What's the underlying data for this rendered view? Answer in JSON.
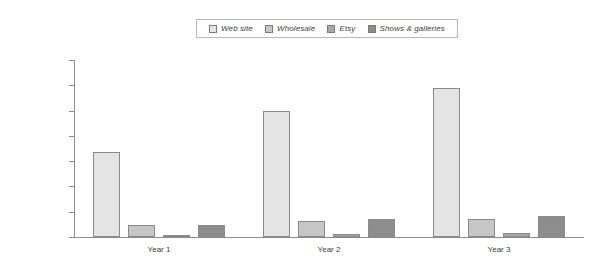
{
  "chart_data": {
    "type": "bar",
    "title": "",
    "xlabel": "",
    "ylabel": "",
    "categories": [
      "Year 1",
      "Year 2",
      "Year 3"
    ],
    "ylim": [
      0,
      70000
    ],
    "ytick_values": [
      0,
      10000,
      20000,
      30000,
      40000,
      50000,
      60000,
      70000
    ],
    "ytick_labels": [
      "$0",
      "$10,000",
      "$20,000",
      "$30,000",
      "$40,000",
      "$50,000",
      "$60,000",
      "$70,000"
    ],
    "grid": false,
    "legend_position": "top-center",
    "series": [
      {
        "name": "Web site",
        "color": "#e4e4e4",
        "values": [
          33600,
          50000,
          59000
        ]
      },
      {
        "name": "Wholesale",
        "color": "#c6c6c6",
        "values": [
          4700,
          6400,
          7300
        ]
      },
      {
        "name": "Etsy",
        "color": "#a8a8a8",
        "values": [
          900,
          1200,
          1600
        ]
      },
      {
        "name": "Shows & galleries",
        "color": "#8d8d8d",
        "values": [
          4900,
          7000,
          8200
        ]
      }
    ]
  },
  "legend": {
    "items": [
      {
        "label": "Web site"
      },
      {
        "label": "Wholesale"
      },
      {
        "label": "Etsy"
      },
      {
        "label": "Shows & galleries"
      }
    ]
  },
  "axis": {
    "y_labels": [
      "$70,000",
      "$60,000",
      "$50,000",
      "$40,000",
      "$30,000",
      "$20,000",
      "$10,000",
      "$0"
    ],
    "x_labels": [
      "Year 1",
      "Year 2",
      "Year 3"
    ]
  }
}
